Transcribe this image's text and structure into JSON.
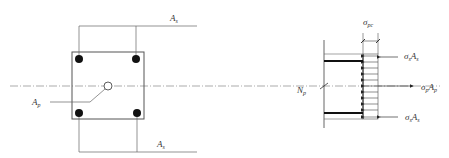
{
  "diagram": {
    "type": "prestressed section force equilibrium",
    "cross_section": {
      "label_steel_top": "A",
      "label_steel_top_sub": "s",
      "label_steel_bottom": "A",
      "label_steel_bottom_sub": "s",
      "label_tendon": "A",
      "label_tendon_sub": "p"
    },
    "force_diagram": {
      "stress_label": "σ",
      "stress_label_sub": "pc",
      "axial_label": "N",
      "axial_label_sub": "p",
      "top_force": {
        "sigma": "σ",
        "sigma_sub": "s",
        "area": "A",
        "area_sub": "s"
      },
      "tendon_force": {
        "sigma": "σ",
        "sigma_sub": "p",
        "area": "A",
        "area_sub": "p"
      },
      "bottom_force": {
        "sigma": "σ",
        "sigma_sub": "s",
        "area": "A",
        "area_sub": "s"
      }
    },
    "colors": {
      "line": "#444444",
      "rebar": "#111111",
      "centerline": "#777777"
    }
  }
}
